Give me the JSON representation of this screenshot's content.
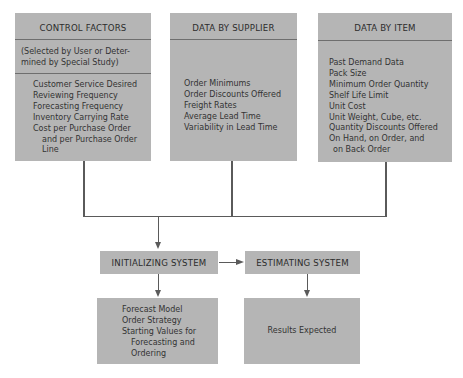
{
  "diagram": {
    "control_factors": {
      "title": "CONTROL FACTORS",
      "subtitle_line1": "(Selected by User or Deter-",
      "subtitle_line2": "mined by Special Study)",
      "items": [
        "Customer Service Desired",
        "Reviewing Frequency",
        "Forecasting Frequency",
        "Inventory Carrying Rate",
        "Cost per Purchase Order",
        "and per Purchase Order",
        "Line"
      ]
    },
    "data_by_supplier": {
      "title": "DATA BY SUPPLIER",
      "items": [
        "Order Minimums",
        "Order Discounts Offered",
        "Freight Rates",
        "Average Lead Time",
        "Variability in Lead Time"
      ]
    },
    "data_by_item": {
      "title": "DATA BY ITEM",
      "items": [
        "Past Demand Data",
        "Pack Size",
        "Minimum Order Quantity",
        "Shelf Life Limit",
        "Unit Cost",
        "Unit Weight, Cube, etc.",
        "Quantity Discounts Offered",
        "On Hand, on Order, and",
        "on Back Order"
      ]
    },
    "initializing_system": {
      "title": "INITIALIZING SYSTEM",
      "outputs": [
        "Forecast Model",
        "Order Strategy",
        "Starting Values for",
        "Forecasting and",
        "Ordering"
      ]
    },
    "estimating_system": {
      "title": "ESTIMATING SYSTEM",
      "output": "Results Expected"
    },
    "colors": {
      "box_fill": "#b5b5b5",
      "line": "#5a5a5a",
      "background": "#ffffff"
    }
  }
}
